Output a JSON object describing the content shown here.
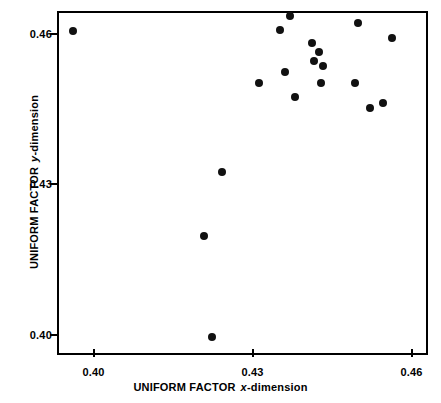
{
  "chart_data": {
    "type": "scatter",
    "title": "",
    "xlabel": "UNIFORM FACTOR x-dimension",
    "ylabel": "UNIFORM FACTOR y-dimension",
    "xlabel_parts": {
      "prefix": "UNIFORM FACTOR",
      "italic": "x",
      "suffix": "-dimension"
    },
    "ylabel_parts": {
      "prefix": "UNIFORM FACTOR",
      "italic": "y",
      "suffix": "-dimension"
    },
    "xlim": [
      0.3931,
      0.4631
    ],
    "ylim": [
      0.396,
      0.4645
    ],
    "xticks": [
      0.4,
      0.43,
      0.46
    ],
    "yticks": [
      0.4,
      0.43,
      0.46
    ],
    "xticklabels": [
      "0.40",
      "0.43",
      "0.46"
    ],
    "yticklabels": [
      "0.40",
      "0.43",
      "0.46"
    ],
    "grid": false,
    "legend": null,
    "marker": "filled-circle",
    "marker_color": "#111111",
    "n_points": 19,
    "points": [
      {
        "x": 0.3958,
        "y": 0.461
      },
      {
        "x": 0.4219,
        "y": 0.3999
      },
      {
        "x": 0.4205,
        "y": 0.42
      },
      {
        "x": 0.4239,
        "y": 0.4328
      },
      {
        "x": 0.4309,
        "y": 0.4505
      },
      {
        "x": 0.4348,
        "y": 0.4612
      },
      {
        "x": 0.4357,
        "y": 0.4527
      },
      {
        "x": 0.4366,
        "y": 0.464
      },
      {
        "x": 0.4409,
        "y": 0.4585
      },
      {
        "x": 0.4421,
        "y": 0.4567
      },
      {
        "x": 0.4412,
        "y": 0.455
      },
      {
        "x": 0.4426,
        "y": 0.4505
      },
      {
        "x": 0.4429,
        "y": 0.454
      },
      {
        "x": 0.4489,
        "y": 0.4505
      },
      {
        "x": 0.4496,
        "y": 0.4625
      },
      {
        "x": 0.4518,
        "y": 0.4455
      },
      {
        "x": 0.4542,
        "y": 0.4465
      },
      {
        "x": 0.4559,
        "y": 0.4595
      },
      {
        "x": 0.4376,
        "y": 0.4478
      }
    ]
  }
}
